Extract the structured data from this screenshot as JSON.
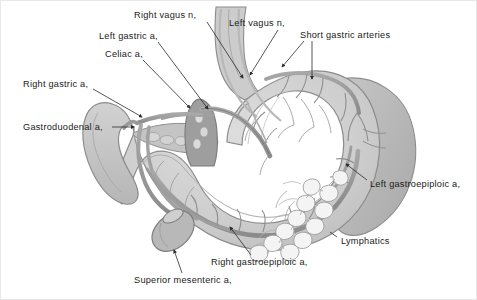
{
  "figure": {
    "background_color": "#ffffff",
    "border_color": "#e8e8e8",
    "width": 477,
    "height": 300
  },
  "palette": {
    "organ_fill": "#c9c9c9",
    "organ_fill_light": "#d6d6d6",
    "organ_fill_lighter": "#dedede",
    "organ_fill_dark": "#b4b4b4",
    "organ_outline": "#8c8c8c",
    "vessel_fill": "#9a9a9a",
    "vessel_outline": "#6f6f6f",
    "celiac_trunk": "#8e8e8e",
    "lymphatic_outline": "#9d9d9d",
    "lymphatic_fill": "#f2f2f2",
    "leader_line": "#2b2b2b",
    "label_text": "#1a1a1a",
    "duodenum_fill": "#c2c2c2",
    "pancreas_fill": "#bdbdbd"
  },
  "labels": [
    {
      "id": "right-vagus-n",
      "text": "Right vagus n,",
      "x": 133,
      "y": 9,
      "anchor": "start",
      "leader": {
        "x1": 206,
        "y1": 21,
        "x2": 242,
        "y2": 77,
        "arrow": true
      }
    },
    {
      "id": "left-vagus-n",
      "text": "Left vagus n,",
      "x": 228,
      "y": 17,
      "anchor": "start",
      "leader": {
        "x1": 277,
        "y1": 29,
        "x2": 248,
        "y2": 76,
        "arrow": true
      }
    },
    {
      "id": "short-gastric-arteries",
      "text": "Short gastric arteries",
      "x": 299,
      "y": 29,
      "anchor": "start",
      "leader": {
        "x1": 311,
        "y1": 40,
        "x2": 311,
        "y2": 80,
        "arrow": true
      },
      "leader2": {
        "x1": 303,
        "y1": 40,
        "x2": 280,
        "y2": 68,
        "arrow": true
      }
    },
    {
      "id": "left-gastric-a",
      "text": "Left gastric a,",
      "x": 98,
      "y": 30,
      "anchor": "start",
      "leader": {
        "x1": 157,
        "y1": 41,
        "x2": 208,
        "y2": 110,
        "arrow": true
      }
    },
    {
      "id": "celiac-a",
      "text": "Celiac a,",
      "x": 104,
      "y": 48,
      "anchor": "start",
      "leader": {
        "x1": 142,
        "y1": 59,
        "x2": 190,
        "y2": 109,
        "arrow": true
      }
    },
    {
      "id": "right-gastric-a",
      "text": "Right gastric a,",
      "x": 22,
      "y": 78,
      "anchor": "start",
      "leader": {
        "x1": 92,
        "y1": 88,
        "x2": 142,
        "y2": 117,
        "arrow": true
      }
    },
    {
      "id": "gastroduodenal-a",
      "text": "Gastroduodenal a,",
      "x": 22,
      "y": 121,
      "anchor": "start",
      "leader": {
        "x1": 111,
        "y1": 126,
        "x2": 133,
        "y2": 126,
        "arrow": true
      }
    },
    {
      "id": "left-gastroepiploic-a",
      "text": "Left gastroepiploic a,",
      "x": 369,
      "y": 178,
      "anchor": "start",
      "leader": {
        "x1": 366,
        "y1": 179,
        "x2": 345,
        "y2": 164,
        "arrow": true
      }
    },
    {
      "id": "lymphatics",
      "text": "Lymphatics",
      "x": 340,
      "y": 235,
      "anchor": "start",
      "leader": null
    },
    {
      "id": "right-gastroepiploic-a",
      "text": "Right gastroepiploic a,",
      "x": 210,
      "y": 256,
      "anchor": "start",
      "leader": {
        "x1": 250,
        "y1": 254,
        "x2": 228,
        "y2": 224,
        "arrow": true
      }
    },
    {
      "id": "superior-mesenteric-a",
      "text": "Superior mesenteric a,",
      "x": 133,
      "y": 274,
      "anchor": "start",
      "leader": {
        "x1": 181,
        "y1": 272,
        "x2": 172,
        "y2": 249,
        "arrow": true
      }
    }
  ],
  "structures": [
    {
      "id": "stomach-body",
      "name": "stomach-body"
    },
    {
      "id": "esophagus",
      "name": "esophagus"
    },
    {
      "id": "fundus",
      "name": "gastric-fundus"
    },
    {
      "id": "antrum-pylorus",
      "name": "antrum-and-pylorus"
    },
    {
      "id": "duodenum",
      "name": "duodenum"
    },
    {
      "id": "spleen",
      "name": "spleen"
    },
    {
      "id": "pancreas",
      "name": "pancreas"
    },
    {
      "id": "celiac-trunk",
      "name": "celiac-trunk"
    },
    {
      "id": "lymphatic-chain",
      "name": "lymphatic-node-chain"
    }
  ]
}
